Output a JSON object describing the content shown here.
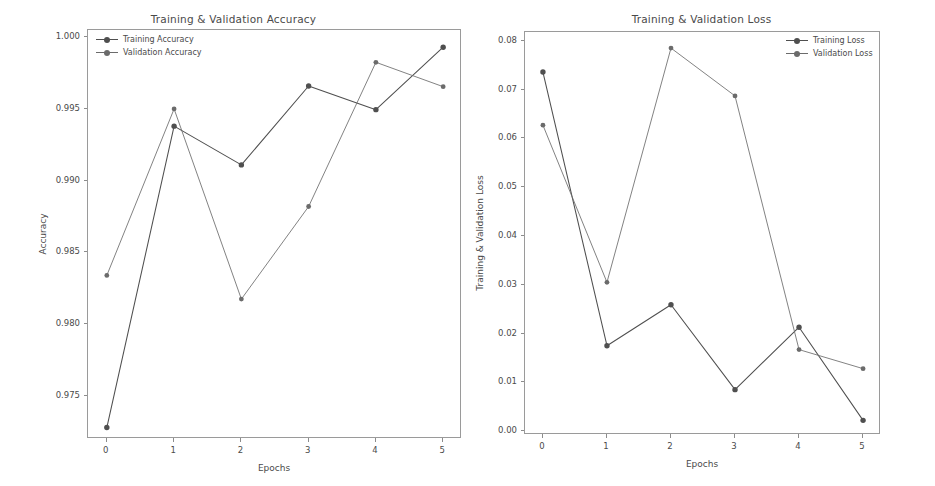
{
  "figure": {
    "width": 935,
    "height": 486,
    "background": "#ffffff"
  },
  "chart_data": [
    {
      "type": "line",
      "title": "Training & Validation Accuracy",
      "xlabel": "Epochs",
      "ylabel": "Accuracy",
      "x": [
        0,
        1,
        2,
        3,
        4,
        5
      ],
      "xtick_labels": [
        "0",
        "1",
        "2",
        "3",
        "4",
        "5"
      ],
      "ytick_values": [
        1.0,
        0.995,
        0.99,
        0.985,
        0.98,
        0.975
      ],
      "ytick_labels": [
        "1.000",
        "0.995",
        "0.990",
        "0.985",
        "0.980",
        "0.975"
      ],
      "xlim": [
        -0.28,
        5.28
      ],
      "ylim": [
        0.972,
        1.0005
      ],
      "grid": false,
      "legend_position": "upper left",
      "series": [
        {
          "name": "Training Accuracy",
          "color": "#4f4f4f",
          "marker": "o",
          "values": [
            0.9728,
            0.9938,
            0.9911,
            0.9966,
            0.99495,
            0.9993
          ]
        },
        {
          "name": "Validation Accuracy",
          "color": "#6b6b6b",
          "marker": "o",
          "values": [
            0.9834,
            0.995,
            0.98175,
            0.9882,
            0.99825,
            0.99655
          ]
        }
      ]
    },
    {
      "type": "line",
      "title": "Training & Validation Loss",
      "xlabel": "Epochs",
      "ylabel": "Training & Validation Loss",
      "x": [
        0,
        1,
        2,
        3,
        4,
        5
      ],
      "xtick_labels": [
        "0",
        "1",
        "2",
        "3",
        "4",
        "5"
      ],
      "ytick_values": [
        0.08,
        0.07,
        0.06,
        0.05,
        0.04,
        0.03,
        0.02,
        0.01,
        0.0
      ],
      "ytick_labels": [
        "0.08",
        "0.07",
        "0.06",
        "0.05",
        "0.04",
        "0.03",
        "0.02",
        "0.01",
        "0.00"
      ],
      "xlim": [
        -0.28,
        5.28
      ],
      "ylim": [
        -0.0008,
        0.0818
      ],
      "grid": false,
      "legend_position": "upper right",
      "series": [
        {
          "name": "Training Loss",
          "color": "#4f4f4f",
          "marker": "o",
          "values": [
            0.0736,
            0.0175,
            0.0259,
            0.0085,
            0.0213,
            0.0022
          ]
        },
        {
          "name": "Validation Loss",
          "color": "#6b6b6b",
          "marker": "o",
          "values": [
            0.0627,
            0.0305,
            0.0785,
            0.0687,
            0.0167,
            0.0128
          ]
        }
      ]
    }
  ]
}
